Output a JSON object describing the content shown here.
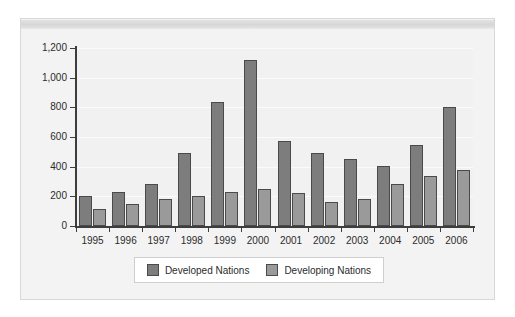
{
  "chart_data": {
    "type": "bar",
    "title": "",
    "subtitle": "",
    "xlabel": "",
    "ylabel": "",
    "categories": [
      "1995",
      "1996",
      "1997",
      "1998",
      "1999",
      "2000",
      "2001",
      "2002",
      "2003",
      "2004",
      "2005",
      "2006"
    ],
    "series": [
      {
        "name": "Developed Nations",
        "color": "#7d7d7d",
        "values": [
          200,
          230,
          280,
          490,
          835,
          1120,
          570,
          495,
          450,
          405,
          545,
          800
        ]
      },
      {
        "name": "Developing Nations",
        "color": "#9a9a9a",
        "values": [
          115,
          150,
          185,
          205,
          230,
          250,
          225,
          165,
          180,
          285,
          340,
          375
        ]
      }
    ],
    "ylim": [
      0,
      1200
    ],
    "yticks": [
      0,
      200,
      400,
      600,
      800,
      1000,
      1200
    ],
    "ytick_labels": [
      "0",
      "200",
      "400",
      "600",
      "800",
      "1,000",
      "1,200"
    ],
    "grid": true,
    "grid_axis": "y",
    "legend_position": "bottom",
    "bar_border_color": "#4a4a4a",
    "plot_background": "#f1f1f1",
    "figure_background": "#f3f3f3",
    "gridline_color": "#fbfbfb",
    "axis_color": "#3d3d3d"
  },
  "legend": {
    "items": [
      {
        "label": "Developed Nations"
      },
      {
        "label": "Developing Nations"
      }
    ]
  }
}
